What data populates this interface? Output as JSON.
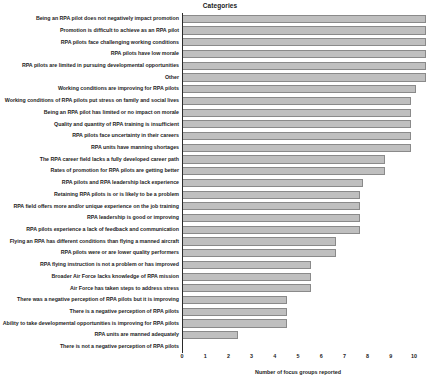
{
  "chart_data": {
    "type": "bar",
    "orientation": "horizontal",
    "title": "Categories",
    "xlabel": "Number of focus groups reported",
    "ylabel": "",
    "xlim": [
      0,
      10
    ],
    "xticks": [
      0,
      1,
      2,
      3,
      4,
      5,
      6,
      7,
      8,
      9,
      10
    ],
    "grid": false,
    "legend": false,
    "bar_color": "#bfbfbf",
    "bar_edge_color": "#8a8a8a",
    "categories": [
      "Being an RPA pilot does not negatively impact promotion",
      "Promotion is difficult to achieve as an RPA pilot",
      "RPA pilots face challenging working conditions",
      "RPA pilots have low morale",
      "RPA pilots are limited in pursuing developmental opportunities",
      "Other",
      "Working conditions are improving for RPA pilots",
      "Working conditions of RPA pilots put stress on family and social lives",
      "Being an RPA pilot has limited or no impact on morale",
      "Quality and quantity of RPA training is insufficient",
      "RPA pilots face uncertainty in their careers",
      "RPA units have manning shortages",
      "The RPA career field lacks a fully developed career path",
      "Rates of promotion for RPA pilots are getting better",
      "RPA pilots and RPA leadership lack experience",
      "Retaining RPA pilots is or is likely to be a problem",
      "RPA field offers more and/or unique experience on the job training",
      "RPA leadership is good or improving",
      "RPA pilots experience a lack of feedback and communication",
      "Flying an RPA has different conditions than flying a manned aircraft",
      "RPA pilots were or are lower quality performers",
      "RPA flying instruction is not a problem or has improved",
      "Broader Air Force lacks knowledge of RPA mission",
      "Air Force has taken steps to address stress",
      "There was a negative perception of RPA pilots but it is improving",
      "There is a negative perception of RPA pilots",
      "Ability to take developmental opportunities is improving for RPA pilots",
      "RPA units are manned adequately",
      "There is not a negative perception of RPA pilots"
    ],
    "values": [
      10.0,
      10.0,
      10.0,
      10.0,
      10.0,
      10.0,
      9.6,
      9.4,
      9.4,
      9.4,
      9.4,
      9.4,
      8.3,
      8.3,
      7.4,
      7.3,
      7.3,
      7.3,
      7.3,
      6.3,
      6.3,
      5.3,
      5.3,
      5.3,
      4.3,
      4.3,
      4.3,
      2.3,
      0.0
    ]
  }
}
